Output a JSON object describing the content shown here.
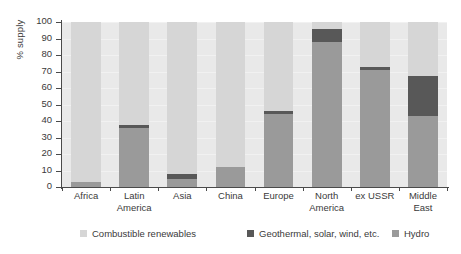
{
  "chart_data": {
    "type": "bar",
    "stacked": true,
    "title": "",
    "xlabel": "",
    "ylabel": "% supply",
    "ylim": [
      0,
      100
    ],
    "yticks": [
      0,
      10,
      20,
      30,
      40,
      50,
      60,
      70,
      80,
      90,
      100
    ],
    "grid": true,
    "legend_position": "bottom",
    "categories": [
      "Africa",
      "Latin America",
      "Asia",
      "China",
      "Europe",
      "North America",
      "ex USSR",
      "Middle East"
    ],
    "category_lines": [
      [
        "Africa"
      ],
      [
        "Latin",
        "America"
      ],
      [
        "Asia"
      ],
      [
        "China"
      ],
      [
        "Europe"
      ],
      [
        "North",
        "America"
      ],
      [
        "ex USSR"
      ],
      [
        "Middle",
        "East"
      ]
    ],
    "series": [
      {
        "name": "Hydro",
        "color": "#9a9a9a",
        "values": [
          3,
          36,
          5,
          12,
          44,
          88,
          71,
          43
        ]
      },
      {
        "name": "Geothermal, solar, wind, etc.",
        "color": "#585858",
        "values": [
          0,
          1.5,
          3,
          0,
          2,
          8,
          1.5,
          24
        ]
      },
      {
        "name": "Combustible renewables",
        "color": "#d6d6d6",
        "values": [
          97,
          62.5,
          92,
          88,
          54,
          4,
          27.5,
          33
        ]
      }
    ],
    "stack_order_bottom_to_top": [
      "Hydro",
      "Geothermal, solar, wind, etc.",
      "Combustible renewables"
    ],
    "colors": {
      "combustible_renewables": "#d6d6d6",
      "geothermal_solar_wind": "#585858",
      "hydro": "#9a9a9a",
      "plot_background": "#e9e9e9",
      "axis": "#4a4a4a",
      "text": "#3a3a3a"
    }
  },
  "legend": {
    "items": [
      {
        "label": "Combustible renewables",
        "color": "#d6d6d6"
      },
      {
        "label": "Geothermal, solar, wind, etc.",
        "color": "#585858"
      },
      {
        "label": "Hydro",
        "color": "#9a9a9a"
      }
    ]
  }
}
